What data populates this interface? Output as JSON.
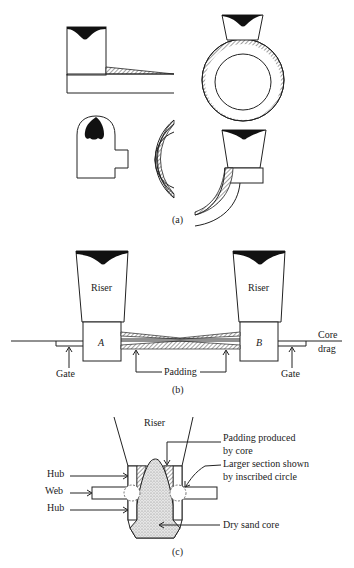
{
  "figure": {
    "panel_a": {
      "caption": "(a)"
    },
    "panel_b": {
      "caption": "(b)",
      "riser_left": "Riser",
      "riser_right": "Riser",
      "block_left": "A",
      "block_right": "B",
      "gate_left": "Gate",
      "gate_right": "Gate",
      "padding": "Padding",
      "core": "Core",
      "drag": "drag"
    },
    "panel_c": {
      "caption": "(c)",
      "riser": "Riser",
      "hub_top": "Hub",
      "web": "Web",
      "hub_bottom": "Hub",
      "padding_line1": "Padding produced",
      "padding_line2": "by core",
      "larger_line1": "Larger section shown",
      "larger_line2": "by inscribed circle",
      "dry_sand_core": "Dry sand core"
    }
  },
  "colors": {
    "ink": "#222222",
    "background": "#ffffff",
    "hatch": "#555555",
    "stipple": "#cfcfcf"
  }
}
